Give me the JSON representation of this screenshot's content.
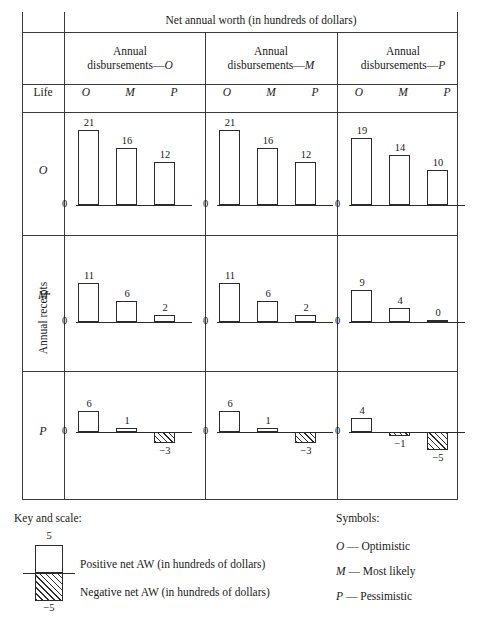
{
  "header": {
    "top_title": "Net annual worth (in hundreds of dollars)",
    "col_groups": [
      {
        "line1": "Annual",
        "line2": "disbursements—",
        "tag": "O"
      },
      {
        "line1": "Annual",
        "line2": "disbursements—",
        "tag": "M"
      },
      {
        "line1": "Annual",
        "line2": "disbursements—",
        "tag": "P"
      }
    ],
    "life_label": "Life",
    "sub_headers": [
      "O",
      "M",
      "P"
    ]
  },
  "row_axis": {
    "vertical_label": "Annual receipts",
    "row_labels": [
      "O",
      "M",
      "P"
    ]
  },
  "legend": {
    "key_title": "Key and scale:",
    "scale_top": "5",
    "scale_bottom": "−5",
    "positive_text": "Positive net AW (in hundreds of dollars)",
    "negative_text": "Negative net AW (in hundreds of dollars)",
    "symbols_title": "Symbols:",
    "symbols": [
      {
        "letter": "O",
        "dash": " — ",
        "meaning": "Optimistic"
      },
      {
        "letter": "M",
        "dash": " — ",
        "meaning": "Most likely"
      },
      {
        "letter": "P",
        "dash": " — ",
        "meaning": "Pessimistic"
      }
    ]
  },
  "chart_data": {
    "type": "bar",
    "title": "Net annual worth (in hundreds of dollars)",
    "xlabel": "Annual disbursements",
    "ylabel": "Annual receipts",
    "zero_label": "0",
    "categories": [
      "O",
      "M",
      "P"
    ],
    "panels": [
      {
        "receipts": "O",
        "disbursements": "O",
        "values": [
          21,
          16,
          12
        ]
      },
      {
        "receipts": "O",
        "disbursements": "M",
        "values": [
          21,
          16,
          12
        ]
      },
      {
        "receipts": "O",
        "disbursements": "P",
        "values": [
          19,
          14,
          10
        ]
      },
      {
        "receipts": "M",
        "disbursements": "O",
        "values": [
          11,
          6,
          2
        ]
      },
      {
        "receipts": "M",
        "disbursements": "M",
        "values": [
          11,
          6,
          2
        ]
      },
      {
        "receipts": "M",
        "disbursements": "P",
        "values": [
          9,
          4,
          0
        ]
      },
      {
        "receipts": "P",
        "disbursements": "O",
        "values": [
          6,
          1,
          -3
        ]
      },
      {
        "receipts": "P",
        "disbursements": "M",
        "values": [
          6,
          1,
          -3
        ]
      },
      {
        "receipts": "P",
        "disbursements": "P",
        "values": [
          4,
          -1,
          -5
        ]
      }
    ],
    "labels": {
      "p0": [
        "21",
        "16",
        "12"
      ],
      "p1": [
        "21",
        "16",
        "12"
      ],
      "p2": [
        "19",
        "14",
        "10"
      ],
      "p3": [
        "11",
        "6",
        "2"
      ],
      "p4": [
        "11",
        "6",
        "2"
      ],
      "p5": [
        "9",
        "4",
        "0"
      ],
      "p6": [
        "6",
        "1",
        "−3"
      ],
      "p7": [
        "6",
        "1",
        "−3"
      ],
      "p8": [
        "4",
        "−1",
        "−5"
      ]
    },
    "scale_hint": {
      "key_positive": 5,
      "key_negative": -5
    }
  }
}
